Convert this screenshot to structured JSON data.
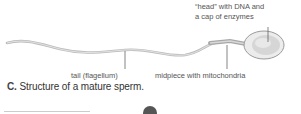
{
  "figure": {
    "labels": {
      "head_line1": "“head” with DNA and",
      "head_line2": "a cap of enzymes",
      "tail": "tail (flagellum)",
      "midpiece": "midpiece with mitochondria"
    },
    "caption_letter": "C.",
    "caption_text": " Structure of a mature sperm."
  },
  "icons": {
    "scroll_up": "chevron-up-icon"
  }
}
